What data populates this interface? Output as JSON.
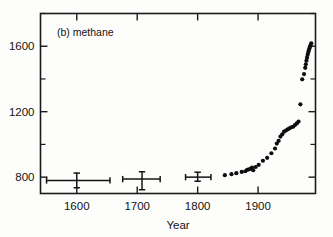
{
  "figure": {
    "panel_title": "(b) methane",
    "ylabel": "CH4 concentration (ppbv)",
    "xlabel": "Year"
  },
  "chart_data": {
    "type": "scatter",
    "title": "(b) methane",
    "xlabel": "Year",
    "ylabel": "CH4 concentration (ppbv)",
    "xlim": [
      1540,
      1995
    ],
    "ylim": [
      700,
      1800
    ],
    "grid": false,
    "legend": "none",
    "xticks": [
      1600,
      1700,
      1800,
      1900
    ],
    "xticklabels": [
      "1600",
      "1700",
      "1800",
      "1900"
    ],
    "yticks": [
      800,
      1200,
      1600
    ],
    "yticklabels": [
      "800",
      "1200",
      "1600"
    ],
    "yticks_minor": [
      1000,
      1400,
      1800
    ],
    "series": [
      {
        "name": "Ice core means with error bars",
        "type": "errorbar",
        "points": [
          {
            "x": 1600,
            "y": 780,
            "xerr_low": 50,
            "xerr_high": 55,
            "yerr_low": 45,
            "yerr_high": 45
          },
          {
            "x": 1708,
            "y": 788,
            "xerr_low": 32,
            "xerr_high": 30,
            "yerr_low": 65,
            "yerr_high": 45
          },
          {
            "x": 1800,
            "y": 800,
            "xerr_low": 20,
            "xerr_high": 22,
            "yerr_low": 25,
            "yerr_high": 30
          }
        ]
      },
      {
        "name": "Ice core and atmospheric measurements",
        "type": "scatter",
        "x": [
          1845,
          1856,
          1864,
          1873,
          1879,
          1882,
          1885,
          1888,
          1890,
          1892,
          1896,
          1901,
          1908,
          1915,
          1922,
          1928,
          1931,
          1934,
          1937,
          1940,
          1943,
          1946,
          1949,
          1952,
          1955,
          1958,
          1961,
          1964,
          1967,
          1970,
          1973,
          1976,
          1978,
          1979,
          1980,
          1981,
          1982,
          1983,
          1984,
          1985,
          1986,
          1987,
          1988
        ],
        "y": [
          812,
          818,
          824,
          832,
          836,
          845,
          848,
          852,
          858,
          842,
          862,
          875,
          900,
          918,
          946,
          975,
          1005,
          1022,
          1048,
          1062,
          1078,
          1085,
          1092,
          1098,
          1105,
          1108,
          1118,
          1128,
          1140,
          1245,
          1398,
          1430,
          1468,
          1490,
          1512,
          1530,
          1548,
          1562,
          1575,
          1588,
          1598,
          1608,
          1618
        ]
      }
    ]
  }
}
